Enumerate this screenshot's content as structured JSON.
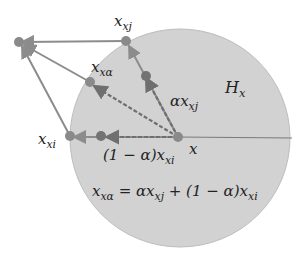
{
  "diagram": {
    "colors": {
      "halfspace_fill": "#d2d2d2",
      "halfspace_edge": "#b9b9b9",
      "line": "#8c8c8c",
      "dark_line": "#6f6f6f",
      "point": "#8a8a8a",
      "point_dark": "#737373",
      "text": "#222222"
    },
    "labels": {
      "x_xj": {
        "base": "x",
        "sub": "xj"
      },
      "x_xalpha": {
        "base": "x",
        "sub": "xα"
      },
      "alpha_x_xj": {
        "base": "αx",
        "sub": "xj"
      },
      "H_x": {
        "base": "H",
        "sub": "x"
      },
      "x_xi": {
        "base": "x",
        "sub": "xi"
      },
      "x": {
        "base": "x"
      },
      "one_minus_alpha_x_xi": {
        "base": "(1 − α)x",
        "sub": "xi"
      },
      "equation": {
        "lhs_base": "x",
        "lhs_sub": "xα",
        "mid": " = αx",
        "mid_sub": "xj",
        "rhs": " + (1 − α)x",
        "rhs_sub": "xi"
      }
    }
  }
}
